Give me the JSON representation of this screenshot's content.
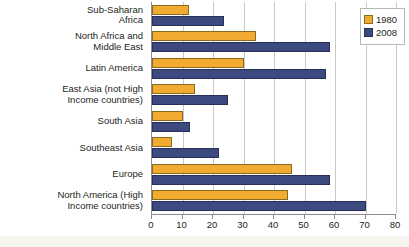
{
  "chart_data": {
    "type": "bar",
    "orientation": "horizontal",
    "title": "",
    "subtitle": "",
    "xlabel": "",
    "ylabel": "",
    "xlim": [
      0,
      80
    ],
    "xticks": [
      0,
      10,
      20,
      30,
      40,
      50,
      60,
      70,
      80
    ],
    "grid": true,
    "legend_position": "top-right",
    "categories": [
      "Sub-Saharan\nAfrica",
      "North Africa and\nMiddle East",
      "Latin America",
      "East Asia (not High\nIncome countries)",
      "South Asia",
      "Southeast Asia",
      "Europe",
      "North America (High\nIncome countries)"
    ],
    "series": [
      {
        "name": "1980",
        "color": "#f0ab30",
        "values": [
          12,
          34,
          30,
          14,
          10,
          6.5,
          46,
          44.5
        ]
      },
      {
        "name": "2008",
        "color": "#3d4a80",
        "values": [
          23.5,
          58.5,
          57,
          25,
          12.5,
          22,
          58.5,
          70
        ]
      }
    ]
  },
  "legend": {
    "items": [
      {
        "label": "1980",
        "swatch": "series-1980-swatch"
      },
      {
        "label": "2008",
        "swatch": "series-2008-swatch"
      }
    ]
  },
  "axis": {
    "tick_labels": [
      "0",
      "10",
      "20",
      "30",
      "40",
      "50",
      "60",
      "70",
      "80"
    ]
  },
  "colors": {
    "series_1980": "#f0ab30",
    "series_2008": "#3d4a80",
    "gridline": "#c9c9c9",
    "axis": "#8c8c8c",
    "text": "#231f20",
    "background": "#ffffff"
  }
}
